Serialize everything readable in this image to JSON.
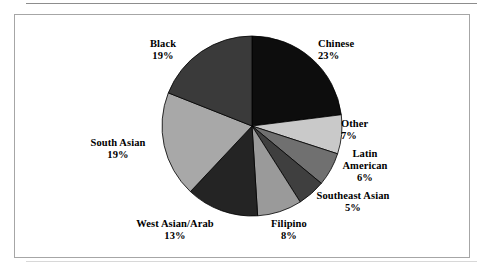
{
  "chart_data": {
    "type": "pie",
    "title": "",
    "subtitle": "",
    "xlabel": "",
    "ylabel": "",
    "legend_position": "none",
    "grid": false,
    "labels_show_percent": true,
    "start_angle_deg": 0,
    "direction": "clockwise",
    "categories": [
      "Chinese",
      "Other",
      "Latin American",
      "Southeast Asian",
      "Filipino",
      "West Asian/Arab",
      "South Asian",
      "Black"
    ],
    "values": [
      23,
      7,
      6,
      5,
      8,
      13,
      19,
      19
    ],
    "value_suffix": "%",
    "slices": [
      {
        "label": "Chinese",
        "value": 23,
        "pct_text": "23%",
        "color": "#0d0d0d"
      },
      {
        "label": "Other",
        "value": 7,
        "pct_text": "7%",
        "color": "#c9c9c9"
      },
      {
        "label": "Latin American",
        "value": 6,
        "pct_text": "6%",
        "color": "#707070"
      },
      {
        "label": "Southeast Asian",
        "value": 5,
        "pct_text": "5%",
        "color": "#3f3f3f"
      },
      {
        "label": "Filipino",
        "value": 8,
        "pct_text": "8%",
        "color": "#9a9a9a"
      },
      {
        "label": "West Asian/Arab",
        "value": 13,
        "pct_text": "13%",
        "color": "#242424"
      },
      {
        "label": "South Asian",
        "value": 19,
        "pct_text": "19%",
        "color": "#a8a8a8"
      },
      {
        "label": "Black",
        "value": 19,
        "pct_text": "19%",
        "color": "#3a3a3a"
      }
    ]
  },
  "labels": {
    "chinese": {
      "name": "Chinese",
      "pct": "23%"
    },
    "other": {
      "name": "Other",
      "pct": "7%"
    },
    "latin_line1": "Latin",
    "latin_line2": "American",
    "latin_pct": "6%",
    "southeast": {
      "name": "Southeast Asian",
      "pct": "5%"
    },
    "filipino": {
      "name": "Filipino",
      "pct": "8%"
    },
    "westasian": {
      "name": "West Asian/Arab",
      "pct": "13%"
    },
    "southasian": {
      "name": "South Asian",
      "pct": "19%"
    },
    "black": {
      "name": "Black",
      "pct": "19%"
    }
  },
  "style": {
    "frame_border_color": "#a6a6a6",
    "rule_color": "#8d8d8d",
    "background": "#ffffff",
    "slice_outline_color": "#000000"
  }
}
